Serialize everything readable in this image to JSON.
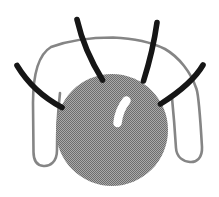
{
  "figure": {
    "width": "219",
    "height": "197",
    "background": "#ffffff",
    "colors": {
      "halftone_light": "#a9a9a9",
      "halftone_dark": "#6d6d6d",
      "wire": "#858585",
      "bristle": "#161616",
      "highlight": "#ffffff"
    },
    "sphere": {
      "cx": "112",
      "cy": "130",
      "r": "56"
    },
    "wire": {
      "stroke_width": "2.6",
      "path": "M 60,93 C 58,110 57,135 57,150 C 57,162 50,166.5 43.5,166 C 37.5,165.5 33.5,161 33.5,152 L 33,103 C 33,76 38.5,54.5 51,47 C 66,41.5 88,37.5 113,37.5 C 136,38.5 153,43 165,49 C 179,57 191,72.5 196.5,89 C 199,96 201,130 202,147 C 202.5,158 196.5,162.5 190,162 C 183.5,161.5 176.5,157.5 176,148 C 175,132 173.5,113 172,98"
    },
    "highlight": {
      "stroke_width": "8.5",
      "path": "M 126.5,100.5 Q 119,110 117.5,123"
    },
    "bristles": {
      "stroke_width": "5.6",
      "upper_left": "M 17,65.5 Q 33,92 62,107.5",
      "top_left": "M 77,19.5 Q 84,50 102.5,80",
      "top_right": "M 157,22.5 Q 153,51 143.5,81",
      "right": "M 203,65 Q 192,84 160.5,104"
    }
  }
}
